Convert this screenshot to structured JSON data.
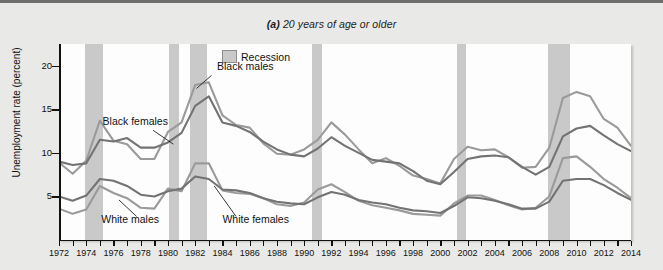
{
  "figure": {
    "panel_label": "(a)",
    "title": "20 years of age or older"
  },
  "legend": {
    "label": "Recession",
    "swatch_color": "#c9c9c9"
  },
  "axes": {
    "y_title": "Unemployment rate (percent)",
    "y_ticks": [
      "5",
      "10",
      "15",
      "20"
    ],
    "x_ticks": [
      "1972",
      "1974",
      "1976",
      "1978",
      "1980",
      "1982",
      "1984",
      "1986",
      "1988",
      "1990",
      "1992",
      "1994",
      "1996",
      "1998",
      "2000",
      "2002",
      "2004",
      "2006",
      "2008",
      "2010",
      "2012",
      "2014"
    ]
  },
  "series_labels": [
    {
      "name": "black-females",
      "text": "Black females"
    },
    {
      "name": "black-males",
      "text": "Black males"
    },
    {
      "name": "white-males",
      "text": "White males"
    },
    {
      "name": "white-females",
      "text": "White females"
    }
  ],
  "chart_data": {
    "type": "line",
    "title": "(a) 20 years of age or older",
    "xlabel": "",
    "ylabel": "Unemployment rate (percent)",
    "xlim": [
      1972,
      2014
    ],
    "ylim": [
      0,
      22.5
    ],
    "ytick_values": [
      5,
      10,
      15,
      20
    ],
    "grid": false,
    "legend_position": "top-center",
    "x": [
      1972,
      1973,
      1974,
      1975,
      1976,
      1977,
      1978,
      1979,
      1980,
      1981,
      1982,
      1983,
      1984,
      1985,
      1986,
      1987,
      1988,
      1989,
      1990,
      1991,
      1992,
      1993,
      1994,
      1995,
      1996,
      1997,
      1998,
      1999,
      2000,
      2001,
      2002,
      2003,
      2004,
      2005,
      2006,
      2007,
      2008,
      2009,
      2010,
      2011,
      2012,
      2013,
      2014
    ],
    "series": [
      {
        "name": "Black males",
        "color": "#9a9a9a",
        "values": [
          8.9,
          7.6,
          9.1,
          13.7,
          11.4,
          11.0,
          9.3,
          9.3,
          12.4,
          13.5,
          17.8,
          18.1,
          14.3,
          13.2,
          12.9,
          11.1,
          9.9,
          9.8,
          10.4,
          11.5,
          13.5,
          12.1,
          10.4,
          8.8,
          9.4,
          8.5,
          7.4,
          7.0,
          6.5,
          9.3,
          10.7,
          10.3,
          10.4,
          9.5,
          8.3,
          8.4,
          10.6,
          16.3,
          17.0,
          16.5,
          13.9,
          12.9,
          10.8
        ]
      },
      {
        "name": "Black females",
        "color": "#737373",
        "values": [
          9.0,
          8.6,
          8.8,
          11.5,
          11.3,
          11.7,
          10.6,
          10.6,
          11.2,
          12.3,
          15.4,
          16.5,
          13.5,
          13.1,
          12.4,
          11.3,
          10.4,
          9.8,
          9.6,
          10.5,
          11.8,
          10.8,
          10.0,
          9.2,
          9.0,
          8.8,
          7.9,
          6.8,
          6.4,
          7.8,
          9.3,
          9.6,
          9.7,
          9.5,
          8.4,
          7.5,
          8.4,
          11.9,
          12.8,
          13.1,
          12.0,
          11.0,
          10.2
        ]
      },
      {
        "name": "White males",
        "color": "#9a9a9a",
        "values": [
          3.6,
          3.0,
          3.5,
          6.2,
          5.4,
          4.8,
          3.7,
          3.6,
          5.9,
          5.6,
          8.8,
          8.8,
          5.7,
          5.4,
          5.3,
          4.8,
          4.1,
          3.9,
          4.3,
          5.8,
          6.4,
          5.5,
          4.5,
          4.0,
          3.7,
          3.4,
          3.0,
          2.9,
          2.8,
          4.2,
          5.1,
          5.1,
          4.6,
          4.0,
          3.5,
          3.7,
          5.0,
          9.4,
          9.6,
          8.4,
          7.0,
          6.0,
          4.8
        ]
      },
      {
        "name": "White females",
        "color": "#737373",
        "values": [
          5.0,
          4.5,
          5.1,
          7.0,
          6.8,
          6.2,
          5.2,
          5.0,
          5.6,
          5.9,
          7.3,
          7.0,
          5.8,
          5.7,
          5.4,
          4.8,
          4.4,
          4.2,
          4.1,
          4.9,
          5.5,
          5.2,
          4.6,
          4.3,
          4.1,
          3.7,
          3.4,
          3.3,
          3.1,
          3.9,
          4.9,
          4.8,
          4.5,
          4.1,
          3.6,
          3.6,
          4.4,
          6.8,
          7.0,
          7.0,
          6.3,
          5.4,
          4.6
        ]
      }
    ],
    "recessions": [
      {
        "start": 1973.9,
        "end": 1975.2
      },
      {
        "start": 1980.1,
        "end": 1980.8
      },
      {
        "start": 1981.6,
        "end": 1982.9
      },
      {
        "start": 1990.6,
        "end": 1991.3
      },
      {
        "start": 2001.2,
        "end": 2001.9
      },
      {
        "start": 2007.9,
        "end": 2009.5
      }
    ],
    "annotations": [
      {
        "text": "Black females",
        "x": 1977.0,
        "y": 13.2
      },
      {
        "text": "Black males",
        "x": 1983.3,
        "y": 19.5
      },
      {
        "text": "White males",
        "x": 1976.5,
        "y": 1.9
      },
      {
        "text": "White females",
        "x": 1985.5,
        "y": 1.9
      },
      {
        "text": "Recession",
        "x": 1984.5,
        "y": 21.5
      }
    ]
  }
}
